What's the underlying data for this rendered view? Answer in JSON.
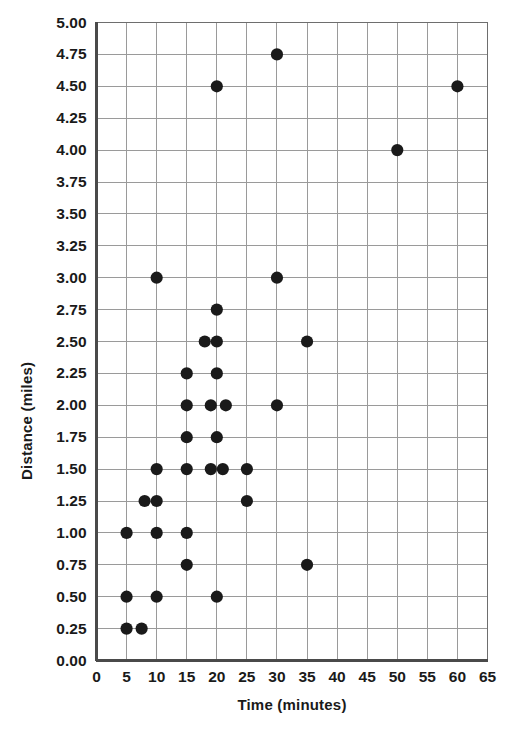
{
  "chart_data": {
    "type": "scatter",
    "title": "",
    "xlabel": "Time (minutes)",
    "ylabel": "Distance (miles)",
    "xlim": [
      0,
      65
    ],
    "ylim": [
      0,
      5
    ],
    "xticks": [
      0,
      5,
      10,
      15,
      20,
      25,
      30,
      35,
      40,
      45,
      50,
      55,
      60,
      65
    ],
    "xtick_labels": [
      "0",
      "5",
      "10",
      "15",
      "20",
      "25",
      "30",
      "35",
      "40",
      "45",
      "50",
      "55",
      "60",
      "65"
    ],
    "yticks": [
      0,
      0.25,
      0.5,
      0.75,
      1,
      1.25,
      1.5,
      1.75,
      2,
      2.25,
      2.5,
      2.75,
      3,
      3.25,
      3.5,
      3.75,
      4,
      4.25,
      4.5,
      4.75,
      5
    ],
    "ytick_labels": [
      "0.00",
      "0.25",
      "0.50",
      "0.75",
      "1.00",
      "1.25",
      "1.50",
      "1.75",
      "2.00",
      "2.25",
      "2.50",
      "2.75",
      "3.00",
      "3.25",
      "3.50",
      "3.75",
      "4.00",
      "4.25",
      "4.50",
      "4.75",
      "5.00"
    ],
    "grid": true,
    "legend": "none",
    "marker_color": "#1a1a1a",
    "marker_size": 9,
    "points": [
      {
        "x": 5,
        "y": 0.25
      },
      {
        "x": 7.5,
        "y": 0.25
      },
      {
        "x": 5,
        "y": 0.5
      },
      {
        "x": 10,
        "y": 0.5
      },
      {
        "x": 20,
        "y": 0.5
      },
      {
        "x": 15,
        "y": 0.75
      },
      {
        "x": 35,
        "y": 0.75
      },
      {
        "x": 5,
        "y": 1.0
      },
      {
        "x": 10,
        "y": 1.0
      },
      {
        "x": 15,
        "y": 1.0
      },
      {
        "x": 8,
        "y": 1.25
      },
      {
        "x": 10,
        "y": 1.25
      },
      {
        "x": 25,
        "y": 1.25
      },
      {
        "x": 10,
        "y": 1.5
      },
      {
        "x": 15,
        "y": 1.5
      },
      {
        "x": 19,
        "y": 1.5
      },
      {
        "x": 21,
        "y": 1.5
      },
      {
        "x": 25,
        "y": 1.5
      },
      {
        "x": 15,
        "y": 1.75
      },
      {
        "x": 20,
        "y": 1.75
      },
      {
        "x": 15,
        "y": 2.0
      },
      {
        "x": 19,
        "y": 2.0
      },
      {
        "x": 21.5,
        "y": 2.0
      },
      {
        "x": 30,
        "y": 2.0
      },
      {
        "x": 15,
        "y": 2.25
      },
      {
        "x": 20,
        "y": 2.25
      },
      {
        "x": 18,
        "y": 2.5
      },
      {
        "x": 20,
        "y": 2.5
      },
      {
        "x": 35,
        "y": 2.5
      },
      {
        "x": 20,
        "y": 2.75
      },
      {
        "x": 10,
        "y": 3.0
      },
      {
        "x": 30,
        "y": 3.0
      },
      {
        "x": 50,
        "y": 4.0
      },
      {
        "x": 20,
        "y": 4.5
      },
      {
        "x": 60,
        "y": 4.5
      },
      {
        "x": 30,
        "y": 4.75
      }
    ]
  }
}
